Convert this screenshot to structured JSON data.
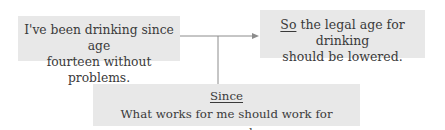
{
  "diagram": {
    "type": "argument-map",
    "premise": {
      "lines": [
        "I've been drinking since age",
        "fourteen without problems."
      ]
    },
    "conclusion": {
      "indicator": "So",
      "rest_line1": " the legal age for drinking",
      "line2": "should be lowered."
    },
    "warrant": {
      "indicator": "Since",
      "text": "What works for me should work for everyone else."
    },
    "colors": {
      "box_fill": "#e8e8e8",
      "connector": "#8c8c8c",
      "text": "#3a3a3a"
    }
  }
}
